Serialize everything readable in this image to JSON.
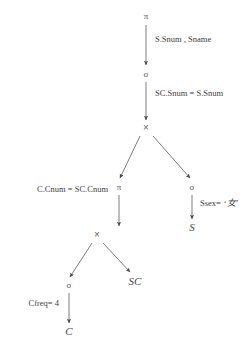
{
  "diagram": {
    "type": "query-tree",
    "stroke_color": "#5a5a5a",
    "text_color": "#3d3d3d",
    "background": "#ffffff",
    "nodes": [
      {
        "id": "proj-root",
        "symbol": "π",
        "kind": "projection",
        "x": 146,
        "y": 16
      },
      {
        "id": "sel-join",
        "symbol": "σ",
        "kind": "selection",
        "x": 146,
        "y": 74
      },
      {
        "id": "cross-top",
        "symbol": "×",
        "kind": "cross-product",
        "x": 146,
        "y": 128
      },
      {
        "id": "proj-left",
        "symbol": "π",
        "kind": "projection",
        "x": 119,
        "y": 187
      },
      {
        "id": "sel-right",
        "symbol": "σ",
        "kind": "selection",
        "x": 192,
        "y": 187
      },
      {
        "id": "cross-lower",
        "symbol": "×",
        "kind": "cross-product",
        "x": 97,
        "y": 235
      },
      {
        "id": "rel-s",
        "symbol": "S",
        "kind": "relation",
        "x": 192,
        "y": 227
      },
      {
        "id": "sel-leaf",
        "symbol": "σ",
        "kind": "selection",
        "x": 69,
        "y": 285
      },
      {
        "id": "rel-sc",
        "symbol": "SC",
        "kind": "relation",
        "x": 135,
        "y": 281
      },
      {
        "id": "rel-c",
        "symbol": "C",
        "kind": "relation",
        "x": 69,
        "y": 331
      }
    ],
    "edges": [
      {
        "id": "e-root",
        "from": "proj-root",
        "to": "sel-join",
        "x1": 146,
        "y1": 25,
        "x2": 146,
        "y2": 65
      },
      {
        "id": "e-sel-cross",
        "from": "sel-join",
        "to": "cross-top",
        "x1": 146,
        "y1": 82,
        "x2": 146,
        "y2": 120
      },
      {
        "id": "e-cross-left",
        "from": "cross-top",
        "to": "proj-left",
        "x1": 140,
        "y1": 136,
        "x2": 120,
        "y2": 178
      },
      {
        "id": "e-cross-right",
        "from": "cross-top",
        "to": "sel-right",
        "x1": 153,
        "y1": 136,
        "x2": 190,
        "y2": 178
      },
      {
        "id": "e-proj-cross",
        "from": "proj-left",
        "to": "cross-lower",
        "x1": 119,
        "y1": 195,
        "x2": 119,
        "y2": 226
      },
      {
        "id": "e-sel-s",
        "from": "sel-right",
        "to": "rel-s",
        "x1": 192,
        "y1": 195,
        "x2": 192,
        "y2": 219
      },
      {
        "id": "e-lower-left",
        "from": "cross-lower",
        "to": "sel-leaf",
        "x1": 92,
        "y1": 243,
        "x2": 70,
        "y2": 277
      },
      {
        "id": "e-lower-right",
        "from": "cross-lower",
        "to": "rel-sc",
        "x1": 103,
        "y1": 243,
        "x2": 130,
        "y2": 272
      },
      {
        "id": "e-sel-c",
        "from": "sel-leaf",
        "to": "rel-c",
        "x1": 69,
        "y1": 293,
        "x2": 69,
        "y2": 323
      }
    ],
    "edge_labels": [
      {
        "id": "lbl-projection",
        "text": "S.Snum , Sname",
        "x": 155,
        "y": 40,
        "anchor": "left"
      },
      {
        "id": "lbl-join-cond",
        "text": "SC.Snum = S.Snum",
        "x": 155,
        "y": 94,
        "anchor": "left"
      },
      {
        "id": "lbl-cnum-cond",
        "text": "C.Cnum = SC.Cnum",
        "x": 108,
        "y": 190,
        "anchor": "right"
      },
      {
        "id": "lbl-cfreq",
        "text": "Cfreq= 4",
        "x": 59,
        "y": 304,
        "anchor": "right"
      }
    ],
    "ssex_label": {
      "id": "lbl-ssex",
      "prefix": "Ssex=",
      "quote_open": "‘",
      "value": "女",
      "quote_close": "’",
      "x": 200,
      "y": 204
    }
  }
}
